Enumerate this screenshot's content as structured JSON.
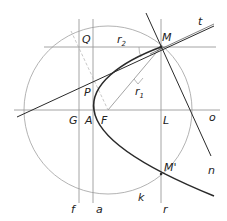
{
  "diagram": {
    "colors": {
      "background": "#ffffff",
      "thin_line": "#9a9a9a",
      "thick_line": "#2a2a2a",
      "text": "#222222"
    },
    "labels": {
      "Q": "Q",
      "r2": "r",
      "r2_sub": "2",
      "M": "M",
      "t": "t",
      "P": "P",
      "r1": "r",
      "r1_sub": "1",
      "G": "G",
      "A": "A",
      "F": "F",
      "L": "L",
      "o": "o",
      "M_prime": "M'",
      "n": "n",
      "f": "f",
      "a": "a",
      "k": "k",
      "r": "r"
    },
    "points": {
      "M": [
        161,
        47
      ],
      "M_prime": [
        161,
        174
      ],
      "F": [
        108,
        110
      ],
      "A": [
        94,
        110
      ],
      "G": [
        79,
        110
      ],
      "L": [
        161,
        110
      ],
      "P": [
        93,
        79
      ],
      "Q": [
        79,
        47
      ]
    },
    "circle_k": {
      "cx": 108,
      "cy": 110,
      "r": 84
    }
  }
}
